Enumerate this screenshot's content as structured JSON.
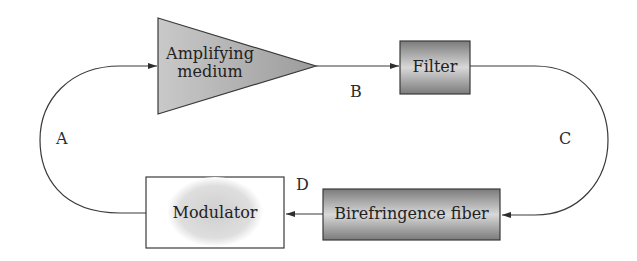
{
  "diagram": {
    "components": {
      "amplifier": {
        "label_line1": "Amplifying",
        "label_line2": "medium"
      },
      "filter": {
        "label": "Filter"
      },
      "birefringence": {
        "label": "Birefringence fiber"
      },
      "modulator": {
        "label": "Modulator"
      }
    },
    "points": {
      "a": "A",
      "b": "B",
      "c": "C",
      "d": "D"
    },
    "colors": {
      "line": "#3a3a3a",
      "dark_fill": "#8a8a8a",
      "light_fill": "#d6d6d6",
      "text": "#222222"
    }
  }
}
